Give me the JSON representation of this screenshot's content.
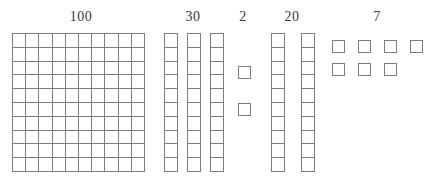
{
  "diagram": {
    "type": "base-ten-blocks",
    "stroke_color": "#7d7d7d",
    "label_color": "#3a3a3a",
    "background": "#ffffff",
    "canvas": {
      "width": 441,
      "height": 190
    }
  },
  "groups": [
    {
      "id": "hundreds",
      "label": "100",
      "value": 100,
      "block_type": "flat",
      "flats": 1,
      "rods": 0,
      "units": 0,
      "label_x": 81,
      "label_y": 10,
      "flat": {
        "x": 12,
        "y": 33,
        "width": 133,
        "height": 139,
        "cols": 10,
        "rows": 10
      }
    },
    {
      "id": "tens-thirty",
      "label": "30",
      "value": 30,
      "block_type": "rod",
      "flats": 0,
      "rods": 3,
      "units": 0,
      "label_x": 193,
      "label_y": 10,
      "rod_list": [
        {
          "x": 164,
          "y": 33,
          "width": 14,
          "height": 139,
          "cells": 10
        },
        {
          "x": 187,
          "y": 33,
          "width": 14,
          "height": 139,
          "cells": 10
        },
        {
          "x": 210,
          "y": 33,
          "width": 14,
          "height": 139,
          "cells": 10
        }
      ]
    },
    {
      "id": "ones-two",
      "label": "2",
      "value": 2,
      "block_type": "unit",
      "flats": 0,
      "rods": 0,
      "units": 2,
      "label_x": 243,
      "label_y": 10,
      "unit_list": [
        {
          "x": 238,
          "y": 66,
          "width": 13,
          "height": 13
        },
        {
          "x": 238,
          "y": 103,
          "width": 13,
          "height": 13
        }
      ]
    },
    {
      "id": "tens-twenty",
      "label": "20",
      "value": 20,
      "block_type": "rod",
      "flats": 0,
      "rods": 2,
      "units": 0,
      "label_x": 292,
      "label_y": 10,
      "rod_list": [
        {
          "x": 271,
          "y": 33,
          "width": 14,
          "height": 139,
          "cells": 10
        },
        {
          "x": 301,
          "y": 33,
          "width": 14,
          "height": 139,
          "cells": 10
        }
      ]
    },
    {
      "id": "ones-seven",
      "label": "7",
      "value": 7,
      "block_type": "unit",
      "flats": 0,
      "rods": 0,
      "units": 7,
      "label_x": 377,
      "label_y": 10,
      "unit_list": [
        {
          "x": 332,
          "y": 40,
          "width": 13,
          "height": 13
        },
        {
          "x": 358,
          "y": 40,
          "width": 13,
          "height": 13
        },
        {
          "x": 384,
          "y": 40,
          "width": 13,
          "height": 13
        },
        {
          "x": 410,
          "y": 40,
          "width": 13,
          "height": 13
        },
        {
          "x": 332,
          "y": 63,
          "width": 13,
          "height": 13
        },
        {
          "x": 358,
          "y": 63,
          "width": 13,
          "height": 13
        },
        {
          "x": 384,
          "y": 63,
          "width": 13,
          "height": 13
        }
      ]
    }
  ]
}
